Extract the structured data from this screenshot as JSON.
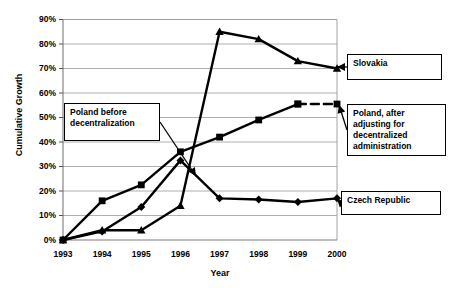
{
  "chart_data": {
    "type": "line",
    "title": "",
    "xlabel": "Year",
    "ylabel": "Cumulative Growth",
    "x": [
      1993,
      1994,
      1995,
      1996,
      1997,
      1998,
      1999,
      2000
    ],
    "xticklabels": [
      "1993",
      "1994",
      "1995",
      "1996",
      "1997",
      "1998",
      "1999",
      "2000"
    ],
    "yticklabels": [
      "0%",
      "10%",
      "20%",
      "30%",
      "40%",
      "50%",
      "60%",
      "70%",
      "80%",
      "90%"
    ],
    "ytickvalues": [
      0,
      10,
      20,
      30,
      40,
      50,
      60,
      70,
      80,
      90
    ],
    "ylim": [
      0,
      90
    ],
    "grid": "horizontal",
    "legend": "annotation-callouts",
    "series": [
      {
        "name": "Slovakia",
        "marker": "triangle",
        "linestyle": "solid",
        "color": "#000000",
        "values": [
          0,
          4,
          4,
          14,
          85,
          82,
          73,
          70
        ]
      },
      {
        "name": "Poland before decentralization",
        "marker": "square",
        "linestyle": "solid",
        "color": "#000000",
        "values": [
          0,
          16,
          22.5,
          36,
          42,
          49,
          55.5,
          null
        ]
      },
      {
        "name": "Poland, after adjusting for decentralized administration",
        "marker": "square",
        "linestyle": "dashed",
        "color": "#000000",
        "values": [
          null,
          null,
          null,
          null,
          null,
          null,
          55.5,
          55.5
        ]
      },
      {
        "name": "Czech Republic",
        "marker": "diamond",
        "linestyle": "solid",
        "color": "#000000",
        "values": [
          0,
          3.5,
          13.5,
          32.5,
          17,
          16.5,
          15.5,
          17
        ]
      }
    ],
    "annotations": [
      {
        "id": "poland-before",
        "lines": [
          "Poland before",
          "decentralization"
        ],
        "box": {
          "x": 64,
          "y": 103,
          "w": 96,
          "h": 38
        },
        "leader_to": {
          "x": 196,
          "y": 176
        }
      },
      {
        "id": "slovakia",
        "lines": [
          "Slovakia"
        ],
        "box": {
          "x": 347,
          "y": 54,
          "w": 95,
          "h": 26
        },
        "leader_to": {
          "x": 337,
          "y": 67
        }
      },
      {
        "id": "poland-after",
        "lines": [
          "Poland, after",
          "adjusting for",
          "decentralized",
          "administration"
        ],
        "box": {
          "x": 347,
          "y": 104,
          "w": 99,
          "h": 52
        },
        "leader_to": {
          "x": 339,
          "y": 105
        }
      },
      {
        "id": "czech-republic",
        "lines": [
          "Czech Republic"
        ],
        "box": {
          "x": 341,
          "y": 191,
          "w": 100,
          "h": 24
        },
        "leader_to": {
          "x": 337,
          "y": 199
        }
      }
    ]
  }
}
